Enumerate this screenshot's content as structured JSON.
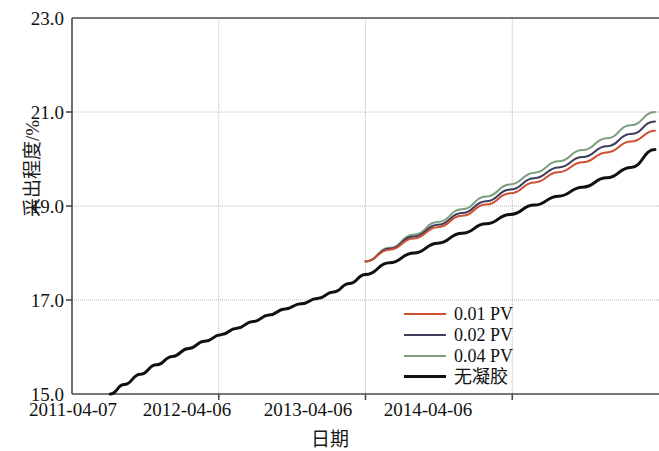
{
  "chart_data": {
    "type": "line",
    "title": "",
    "xlabel": "日期",
    "ylabel": "采出程度/%",
    "grid": true,
    "legend_position": "inside-bottom-center-right",
    "x_ticks": [
      "2011-04-07",
      "2012-04-06",
      "2013-04-06",
      "2014-04-06"
    ],
    "x_tick_positions_days": [
      0,
      365,
      730,
      1095
    ],
    "xlim_days": [
      0,
      1460
    ],
    "y_ticks": [
      "15.0",
      "17.0",
      "19.0",
      "21.0",
      "23.0"
    ],
    "ylim": [
      15.0,
      23.0
    ],
    "x_unit": "date",
    "series": [
      {
        "name": "0.01 PV",
        "color": "#cf4f33",
        "x_days": [
          730,
          790,
          850,
          910,
          970,
          1030,
          1090,
          1150,
          1210,
          1270,
          1330,
          1390,
          1450
        ],
        "values": [
          17.82,
          18.07,
          18.31,
          18.55,
          18.79,
          19.03,
          19.27,
          19.5,
          19.72,
          19.93,
          20.14,
          20.37,
          20.6
        ]
      },
      {
        "name": "0.02 PV",
        "color": "#3d3d5c",
        "x_days": [
          730,
          790,
          850,
          910,
          970,
          1030,
          1090,
          1150,
          1210,
          1270,
          1330,
          1390,
          1450
        ],
        "values": [
          17.82,
          18.09,
          18.35,
          18.6,
          18.85,
          19.1,
          19.35,
          19.59,
          19.82,
          20.04,
          20.27,
          20.53,
          20.8
        ]
      },
      {
        "name": "0.04 PV",
        "color": "#7d9e7f",
        "x_days": [
          730,
          790,
          850,
          910,
          970,
          1030,
          1090,
          1150,
          1210,
          1270,
          1330,
          1390,
          1450
        ],
        "values": [
          17.82,
          18.11,
          18.39,
          18.66,
          18.93,
          19.2,
          19.46,
          19.71,
          19.95,
          20.19,
          20.44,
          20.72,
          21.0
        ]
      },
      {
        "name": "无凝胶",
        "color": "#111111",
        "x_days": [
          95,
          130,
          170,
          210,
          250,
          290,
          330,
          370,
          410,
          450,
          490,
          530,
          570,
          610,
          650,
          690,
          730,
          790,
          850,
          910,
          970,
          1030,
          1090,
          1150,
          1210,
          1270,
          1330,
          1390,
          1450
        ],
        "values": [
          15.0,
          15.2,
          15.42,
          15.62,
          15.8,
          15.97,
          16.12,
          16.26,
          16.4,
          16.54,
          16.68,
          16.81,
          16.92,
          17.03,
          17.17,
          17.35,
          17.54,
          17.79,
          18.0,
          18.21,
          18.42,
          18.62,
          18.82,
          19.02,
          19.21,
          19.4,
          19.6,
          19.82,
          20.2
        ]
      }
    ]
  },
  "legend": {
    "entries": [
      {
        "label": "0.01 PV",
        "color": "#cf4f33"
      },
      {
        "label": "0.02 PV",
        "color": "#3d3d5c"
      },
      {
        "label": "0.04 PV",
        "color": "#7d9e7f"
      },
      {
        "label": "无凝胶",
        "color": "#111111"
      }
    ]
  },
  "axes": {
    "y_label": "采出程度/%",
    "x_label": "日期",
    "y_ticks": [
      "23.0",
      "21.0",
      "19.0",
      "17.0",
      "15.0"
    ],
    "x_ticks": [
      "2011-04-07",
      "2012-04-06",
      "2013-04-06",
      "2014-04-06"
    ]
  },
  "colors": {
    "axis": "#4a4a4a",
    "grid": "#b8b8b8",
    "text": "#111111",
    "background": "#ffffff"
  }
}
